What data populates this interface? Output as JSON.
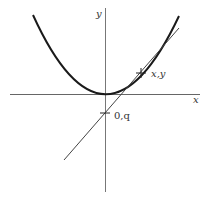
{
  "diagram": {
    "axes": {
      "x_label": "x",
      "y_label": "y"
    },
    "points": {
      "tangent_point_label": "x,y",
      "intercept_label": "0,q"
    },
    "colors": {
      "curve": "#1a1a1a",
      "tangent": "#444444",
      "axes": "#666666",
      "text": "#333333"
    }
  }
}
